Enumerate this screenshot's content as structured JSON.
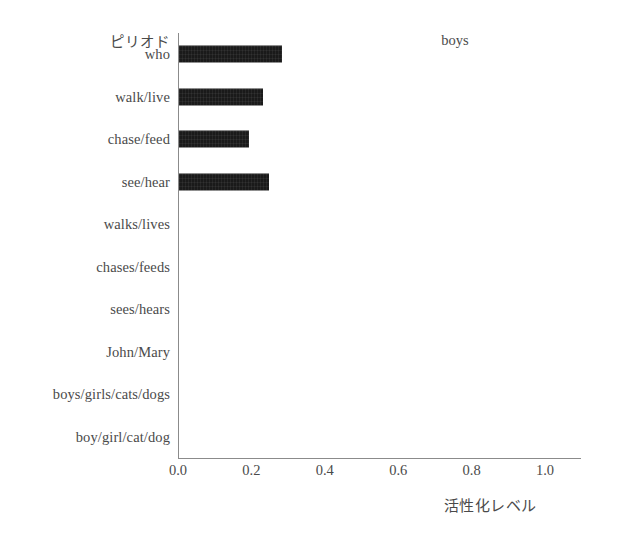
{
  "chart_data": {
    "type": "bar",
    "orientation": "horizontal",
    "title": "boys",
    "xlabel": "活性化レベル",
    "ylabel": "ピリオド",
    "xlim": [
      0.0,
      1.1
    ],
    "xticks": [
      "0.0",
      "0.2",
      "0.4",
      "0.6",
      "0.8",
      "1.0"
    ],
    "xtick_values": [
      0.0,
      0.2,
      0.4,
      0.6,
      0.8,
      1.0
    ],
    "grid": false,
    "legend": "none",
    "bar_color": "#1a1a1a",
    "background": "#ffffff",
    "categories": [
      "who",
      "walk/live",
      "chase/feed",
      "see/hear",
      "walks/lives",
      "chases/feeds",
      "sees/hears",
      "John/Mary",
      "boys/girls/cats/dogs",
      "boy/girl/cat/dog"
    ],
    "values": [
      0.28,
      0.23,
      0.19,
      0.245,
      0.0,
      0.0,
      0.0,
      0.0,
      0.0,
      0.0
    ]
  }
}
